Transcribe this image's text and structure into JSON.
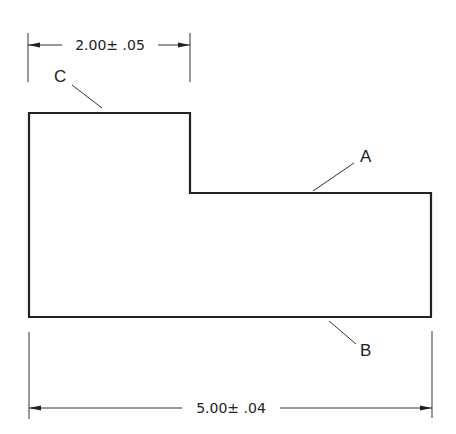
{
  "diagram": {
    "type": "engineering-drawing",
    "colors": {
      "line": "#222222",
      "thin_line": "#333333",
      "background": "#ffffff"
    },
    "dimensions": {
      "top": {
        "value": "2.00",
        "tolerance": "± .05",
        "text": "2.00± .05"
      },
      "bottom": {
        "value": "5.00",
        "tolerance": "± .04",
        "text": "5.00± .04"
      }
    },
    "labels": {
      "a": "A",
      "b": "B",
      "c": "C"
    }
  }
}
